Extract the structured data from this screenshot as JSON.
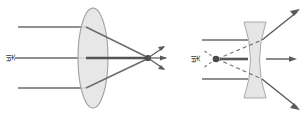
{
  "figure": {
    "background_color": "#ffffff",
    "width": 307,
    "height": 118
  },
  "colors": {
    "ray_stroke": "#6b6b6b",
    "axis_ray_stroke": "#555555",
    "lens_fill": "#e2e2e2",
    "lens_stroke": "#9a9a9a",
    "dashed_stroke": "#7a7a7a",
    "focus_dot": "#4a4a4a",
    "label_text": "#3a3a3a"
  },
  "panels": [
    {
      "id": "convex-lens-panel",
      "name": "convex-lens-diagram",
      "lens_type": "convex",
      "lens_label": "convex-lens",
      "source_label": "빛",
      "source_label_rotation": -90,
      "ray_count": 3,
      "behavior": "converging",
      "focus_point_label": "focal-point",
      "incoming_rays": [
        {
          "name": "ray-top",
          "y": 27
        },
        {
          "name": "ray-middle",
          "y": 58
        },
        {
          "name": "ray-bottom",
          "y": 88
        }
      ],
      "lens": {
        "cx": 93,
        "cy": 58,
        "rx": 15,
        "ry": 50
      },
      "focus": {
        "x": 148,
        "y": 58
      }
    },
    {
      "id": "concave-lens-panel",
      "name": "concave-lens-diagram",
      "lens_type": "concave",
      "lens_label": "concave-lens",
      "source_label": "빛",
      "source_label_rotation": -90,
      "ray_count": 3,
      "behavior": "diverging",
      "focus_point_label": "virtual-focal-point",
      "incoming_rays": [
        {
          "name": "ray-top",
          "y": 40
        },
        {
          "name": "ray-middle",
          "y": 59
        },
        {
          "name": "ray-bottom",
          "y": 79
        }
      ],
      "lens": {
        "cx": 255,
        "cy": 60,
        "half_width": 11,
        "top": 22,
        "bottom": 98
      },
      "virtual_focus": {
        "x": 216,
        "y": 59
      },
      "dashed_construction_lines": 2
    }
  ]
}
